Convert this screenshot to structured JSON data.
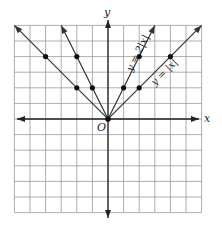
{
  "chart_data": {
    "type": "line",
    "title": "",
    "xlabel": "x",
    "ylabel": "y",
    "origin_label": "O",
    "xlim": [
      -6,
      6
    ],
    "ylim": [
      -6,
      6
    ],
    "grid": true,
    "series": [
      {
        "name": "y = |x|",
        "label": "y = |x|",
        "points": [
          [
            -6,
            6
          ],
          [
            -4,
            4
          ],
          [
            -2,
            2
          ],
          [
            0,
            0
          ],
          [
            2,
            2
          ],
          [
            4,
            4
          ],
          [
            6,
            6
          ]
        ],
        "marked_points": [
          [
            -4,
            4
          ],
          [
            -2,
            2
          ],
          [
            0,
            0
          ],
          [
            2,
            2
          ],
          [
            4,
            4
          ]
        ]
      },
      {
        "name": "y = 2|x|",
        "label": "y = 2|x|",
        "points": [
          [
            -3,
            6
          ],
          [
            -2,
            4
          ],
          [
            -1,
            2
          ],
          [
            0,
            0
          ],
          [
            1,
            2
          ],
          [
            2,
            4
          ],
          [
            3,
            6
          ]
        ],
        "marked_points": [
          [
            -2,
            4
          ],
          [
            -1,
            2
          ],
          [
            0,
            0
          ],
          [
            1,
            2
          ],
          [
            2,
            4
          ]
        ]
      }
    ]
  },
  "labels": {
    "x_axis": "x",
    "y_axis": "y",
    "origin": "O",
    "curve1": "y = 2|x|",
    "curve2": "y = |x|"
  },
  "colors": {
    "grid": "#9a9a9a",
    "axis": "#222222",
    "curve": "#333333"
  }
}
